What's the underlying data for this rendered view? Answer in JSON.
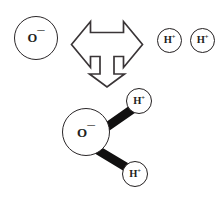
{
  "diagram": {
    "background_color": "#ffffff",
    "stroke_color": "#231f20",
    "bond_color": "#111010",
    "reactants": {
      "molecule": {
        "name": "water-molecule",
        "central_atom": {
          "element": "O",
          "charge": "––",
          "label_text": "O",
          "charge_text": "¯¯"
        },
        "hydrogens": [
          {
            "element": "H",
            "charge": "+",
            "label_text": "H",
            "charge_text": "+"
          },
          {
            "element": "H",
            "charge": "+",
            "label_text": "H",
            "charge_text": "+"
          }
        ],
        "bond_count": 2
      }
    },
    "products": {
      "oxide_ion": {
        "name": "free-oxide-ion",
        "label_text": "O",
        "charge_text": "¯¯"
      },
      "protons": [
        {
          "name": "free-proton-1",
          "label_text": "H",
          "charge_text": "+"
        },
        {
          "name": "free-proton-2",
          "label_text": "H",
          "charge_text": "+"
        }
      ]
    },
    "arrow": {
      "name": "trifurcate-arrow",
      "directions": [
        "left",
        "right",
        "down"
      ],
      "style": "outline",
      "fill": "#ffffff",
      "stroke": "#3a3537"
    }
  }
}
